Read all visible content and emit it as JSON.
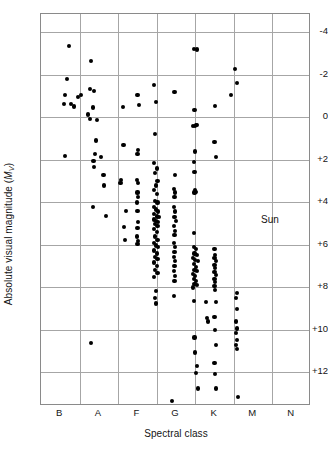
{
  "figure": {
    "xlabel": "Spectral class",
    "ylabel_prefix": "Absolute visual magnitude (",
    "ylabel_symbol": "M",
    "ylabel_sub": "V",
    "ylabel_suffix": ")"
  },
  "annotation": {
    "sun_label": "Sun",
    "sun_x": 6.42,
    "sun_y": 4.83
  },
  "chart_data": {
    "type": "scatter",
    "title": "",
    "xlabel": "Spectral class",
    "ylabel": "Absolute visual magnitude (Mv)",
    "grid": true,
    "legend": null,
    "x_tick_labels": [
      "B",
      "A",
      "F",
      "G",
      "K",
      "M",
      "N"
    ],
    "x_tick_positions": [
      1,
      2,
      3,
      4,
      5,
      6,
      7
    ],
    "x_gridline_positions": [
      1.5,
      2.5,
      3.5,
      4.5,
      5.5,
      6.5
    ],
    "xlim": [
      0.5,
      7.5
    ],
    "y_tick_labels": [
      "-4",
      "-2",
      "0",
      "+2",
      "+4",
      "+6",
      "+8",
      "+10",
      "+12"
    ],
    "y_tick_values": [
      -4,
      -2,
      0,
      2,
      4,
      6,
      8,
      10,
      12
    ],
    "ylim": [
      -4.85,
      13.6
    ],
    "y_axis_inverted": true,
    "marker": "filled-circle",
    "marker_color": "#000000",
    "points": [
      [
        1.22,
        -3.35
      ],
      [
        1.18,
        -1.78
      ],
      [
        1.12,
        -1.05
      ],
      [
        1.1,
        -0.62
      ],
      [
        1.27,
        -0.62
      ],
      [
        1.36,
        -0.5
      ],
      [
        1.45,
        -0.95
      ],
      [
        1.53,
        -1.02
      ],
      [
        1.12,
        1.82
      ],
      [
        1.8,
        -2.65
      ],
      [
        1.76,
        -1.32
      ],
      [
        1.88,
        -1.22
      ],
      [
        1.72,
        -0.12
      ],
      [
        1.78,
        0.08
      ],
      [
        1.84,
        -0.45
      ],
      [
        1.96,
        0.12
      ],
      [
        1.92,
        1.1
      ],
      [
        1.9,
        1.75
      ],
      [
        1.86,
        2.05
      ],
      [
        1.88,
        2.35
      ],
      [
        2.06,
        1.88
      ],
      [
        2.12,
        2.72
      ],
      [
        2.14,
        3.22
      ],
      [
        1.84,
        4.25
      ],
      [
        2.18,
        4.65
      ],
      [
        1.8,
        10.65
      ],
      [
        2.62,
        -0.48
      ],
      [
        2.64,
        1.32
      ],
      [
        2.58,
        2.98
      ],
      [
        2.56,
        3.12
      ],
      [
        2.7,
        4.42
      ],
      [
        2.66,
        5.18
      ],
      [
        2.68,
        5.78
      ],
      [
        3.0,
        -1.05
      ],
      [
        3.04,
        -0.55
      ],
      [
        3.02,
        1.55
      ],
      [
        3.0,
        1.75
      ],
      [
        2.98,
        2.98
      ],
      [
        3.02,
        3.1
      ],
      [
        3.0,
        3.55
      ],
      [
        3.02,
        3.78
      ],
      [
        2.98,
        4.02
      ],
      [
        3.0,
        4.42
      ],
      [
        3.02,
        4.95
      ],
      [
        3.0,
        5.22
      ],
      [
        2.98,
        5.62
      ],
      [
        3.02,
        5.85
      ],
      [
        3.0,
        5.98
      ],
      [
        3.44,
        -1.52
      ],
      [
        3.48,
        -0.72
      ],
      [
        3.46,
        0.78
      ],
      [
        3.44,
        2.15
      ],
      [
        3.5,
        2.42
      ],
      [
        3.46,
        2.62
      ],
      [
        3.52,
        3.02
      ],
      [
        3.48,
        3.22
      ],
      [
        3.44,
        3.45
      ],
      [
        3.5,
        3.62
      ],
      [
        3.46,
        3.95
      ],
      [
        3.52,
        4.02
      ],
      [
        3.42,
        4.22
      ],
      [
        3.48,
        4.35
      ],
      [
        3.54,
        4.45
      ],
      [
        3.44,
        4.58
      ],
      [
        3.5,
        4.68
      ],
      [
        3.56,
        4.72
      ],
      [
        3.42,
        4.82
      ],
      [
        3.48,
        4.88
      ],
      [
        3.54,
        4.95
      ],
      [
        3.46,
        5.05
      ],
      [
        3.52,
        5.12
      ],
      [
        3.44,
        5.28
      ],
      [
        3.5,
        5.42
      ],
      [
        3.46,
        5.62
      ],
      [
        3.52,
        5.78
      ],
      [
        3.42,
        5.92
      ],
      [
        3.48,
        6.05
      ],
      [
        3.54,
        6.12
      ],
      [
        3.44,
        6.28
      ],
      [
        3.5,
        6.42
      ],
      [
        3.46,
        6.58
      ],
      [
        3.52,
        6.68
      ],
      [
        3.44,
        6.85
      ],
      [
        3.5,
        7.02
      ],
      [
        3.46,
        7.18
      ],
      [
        3.52,
        7.35
      ],
      [
        3.44,
        7.52
      ],
      [
        3.48,
        8.18
      ],
      [
        3.46,
        8.52
      ],
      [
        3.48,
        8.78
      ],
      [
        3.96,
        -1.18
      ],
      [
        3.98,
        2.72
      ],
      [
        3.94,
        3.38
      ],
      [
        3.98,
        3.55
      ],
      [
        3.96,
        3.78
      ],
      [
        3.94,
        4.25
      ],
      [
        3.98,
        4.45
      ],
      [
        3.96,
        4.72
      ],
      [
        4.0,
        4.88
      ],
      [
        3.94,
        5.12
      ],
      [
        3.98,
        5.38
      ],
      [
        3.96,
        5.55
      ],
      [
        3.94,
        5.92
      ],
      [
        3.98,
        6.12
      ],
      [
        3.96,
        6.35
      ],
      [
        3.94,
        6.58
      ],
      [
        3.98,
        6.78
      ],
      [
        3.96,
        7.02
      ],
      [
        3.94,
        7.25
      ],
      [
        3.98,
        7.48
      ],
      [
        3.96,
        7.72
      ],
      [
        3.94,
        8.42
      ],
      [
        3.9,
        13.35
      ],
      [
        4.46,
        -3.22
      ],
      [
        4.54,
        -3.18
      ],
      [
        4.48,
        -0.35
      ],
      [
        4.5,
        1.62
      ],
      [
        4.46,
        2.12
      ],
      [
        4.5,
        3.45
      ],
      [
        4.48,
        3.55
      ],
      [
        4.46,
        5.45
      ],
      [
        4.52,
        0.38
      ],
      [
        4.44,
        0.42
      ],
      [
        4.5,
        0.42
      ],
      [
        4.54,
        0.38
      ],
      [
        4.48,
        2.58
      ],
      [
        4.52,
        3.52
      ],
      [
        4.46,
        6.12
      ],
      [
        4.52,
        6.22
      ],
      [
        4.48,
        6.42
      ],
      [
        4.54,
        6.48
      ],
      [
        4.44,
        6.62
      ],
      [
        4.5,
        6.72
      ],
      [
        4.56,
        6.78
      ],
      [
        4.46,
        6.92
      ],
      [
        4.52,
        7.05
      ],
      [
        4.48,
        7.18
      ],
      [
        4.54,
        7.25
      ],
      [
        4.44,
        7.38
      ],
      [
        4.5,
        7.48
      ],
      [
        4.46,
        7.62
      ],
      [
        4.52,
        7.72
      ],
      [
        4.48,
        7.85
      ],
      [
        4.54,
        7.92
      ],
      [
        4.44,
        8.02
      ],
      [
        4.46,
        8.65
      ],
      [
        4.48,
        10.38
      ],
      [
        4.5,
        11.08
      ],
      [
        4.54,
        11.72
      ],
      [
        4.52,
        12.05
      ],
      [
        4.56,
        12.78
      ],
      [
        4.78,
        8.72
      ],
      [
        4.8,
        9.45
      ],
      [
        4.82,
        9.62
      ],
      [
        5.02,
        -0.52
      ],
      [
        5.0,
        1.18
      ],
      [
        5.04,
        1.88
      ],
      [
        5.0,
        6.22
      ],
      [
        5.02,
        6.48
      ],
      [
        5.0,
        6.65
      ],
      [
        5.04,
        6.78
      ],
      [
        5.0,
        6.95
      ],
      [
        5.02,
        7.12
      ],
      [
        5.0,
        7.28
      ],
      [
        5.04,
        7.45
      ],
      [
        5.0,
        7.62
      ],
      [
        5.02,
        7.78
      ],
      [
        5.0,
        7.95
      ],
      [
        5.02,
        8.15
      ],
      [
        5.04,
        8.72
      ],
      [
        5.0,
        9.42
      ],
      [
        5.02,
        10.02
      ],
      [
        5.04,
        10.72
      ],
      [
        5.0,
        11.58
      ],
      [
        5.02,
        12.08
      ],
      [
        5.04,
        12.78
      ],
      [
        5.52,
        -2.25
      ],
      [
        5.58,
        -1.62
      ],
      [
        5.42,
        -1.02
      ],
      [
        5.58,
        8.28
      ],
      [
        5.56,
        8.52
      ],
      [
        5.58,
        9.05
      ],
      [
        5.56,
        9.62
      ],
      [
        5.58,
        9.95
      ],
      [
        5.56,
        10.18
      ],
      [
        5.58,
        10.48
      ],
      [
        5.56,
        10.72
      ],
      [
        5.58,
        10.92
      ],
      [
        5.6,
        13.18
      ]
    ]
  }
}
